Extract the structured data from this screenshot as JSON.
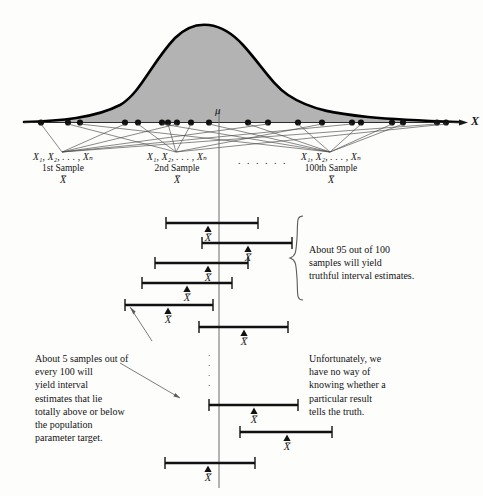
{
  "figure": {
    "axis_label_x": "X",
    "population_mean_symbol": "μ",
    "sample_mean_symbol": "X̅",
    "curve_fill_color": "#b3b3b3",
    "curve_stroke_color": "#000000",
    "interval_color": "#111111",
    "mu_line_color": "#5a5a5a"
  },
  "samples": {
    "variables_text": "X₁, X₂, . . . , Xₙ",
    "ellipsis_between": ". . . . . .",
    "entries": [
      {
        "ordinal": "1st Sample",
        "mean_label": "X̅"
      },
      {
        "ordinal": "2nd Sample",
        "mean_label": "X̅"
      },
      {
        "ordinal": "100th Sample",
        "mean_label": "X̅"
      }
    ]
  },
  "dots_axis": {
    "count": 22,
    "x_positions": [
      41,
      68,
      80,
      125,
      138,
      162,
      168,
      177,
      191,
      209,
      248,
      268,
      298,
      322,
      352,
      361,
      392,
      403,
      437,
      440,
      445,
      446
    ]
  },
  "intervals": {
    "mean_marker": "X̅",
    "rows": [
      {
        "id": 1,
        "left": 166,
        "right": 258,
        "mean_x": 208,
        "y": 223,
        "covers_mu": true
      },
      {
        "id": 2,
        "left": 202,
        "right": 292,
        "mean_x": 248,
        "y": 243,
        "covers_mu": true
      },
      {
        "id": 3,
        "left": 155,
        "right": 248,
        "mean_x": 208,
        "y": 263,
        "covers_mu": true
      },
      {
        "id": 4,
        "left": 142,
        "right": 232,
        "mean_x": 187,
        "y": 283,
        "covers_mu": true
      },
      {
        "id": 5,
        "left": 125,
        "right": 213,
        "mean_x": 168,
        "y": 305,
        "covers_mu": false
      },
      {
        "id": 6,
        "left": 199,
        "right": 288,
        "mean_x": 244,
        "y": 327,
        "covers_mu": true
      },
      {
        "id": 7,
        "left": 209,
        "right": 298,
        "mean_x": 254,
        "y": 405,
        "covers_mu": true
      },
      {
        "id": 8,
        "left": 240,
        "right": 332,
        "mean_x": 287,
        "y": 432,
        "covers_mu": false
      },
      {
        "id": 9,
        "left": 165,
        "right": 255,
        "mean_x": 208,
        "y": 463,
        "covers_mu": true
      }
    ],
    "vertical_dots": "⋮"
  },
  "annotations": {
    "brace_note": "About 95 out of 100\nsamples will yield\ntruthful interval estimates.",
    "brace_note_lines": [
      "About 95 out of 100",
      "samples will yield",
      "truthful interval estimates."
    ],
    "left_note_lines": [
      "About 5 samples out of",
      "every 100 will",
      "yield interval",
      "estimates that lie",
      "totally above or below",
      "the population",
      "parameter target."
    ],
    "right_note_lines": [
      "Unfortunately, we",
      "have no way of",
      "knowing whether a",
      "particular result",
      "tells the truth."
    ]
  }
}
